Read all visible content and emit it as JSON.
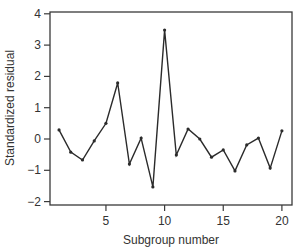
{
  "chart_data": {
    "type": "line",
    "title": "",
    "xlabel": "Subgroup number",
    "ylabel": "Standardized residual",
    "xlim": [
      0.2,
      20.7
    ],
    "ylim": [
      -2.1,
      4.2
    ],
    "xticks": [
      5,
      10,
      15,
      20
    ],
    "xtick_labels": [
      "5",
      "10",
      "15",
      "20"
    ],
    "yticks": [
      -2,
      -1,
      0,
      1,
      2,
      3,
      4
    ],
    "ytick_labels": [
      "−2",
      "−1",
      "0",
      "1",
      "2",
      "3",
      "4"
    ],
    "grid": false,
    "legend": null,
    "markers": true,
    "series": [
      {
        "name": "Standardized residual",
        "x": [
          1,
          2,
          3,
          4,
          5,
          6,
          7,
          8,
          9,
          10,
          11,
          12,
          13,
          14,
          15,
          16,
          17,
          18,
          19,
          20
        ],
        "values": [
          0.29,
          -0.42,
          -0.67,
          -0.06,
          0.5,
          1.79,
          -0.8,
          0.03,
          -1.53,
          3.48,
          -0.51,
          0.32,
          0.0,
          -0.58,
          -0.35,
          -1.02,
          -0.19,
          0.03,
          -0.93,
          0.26
        ]
      }
    ]
  },
  "colors": {
    "line": "#2b2b2b",
    "frame": "#3a3a3a",
    "text": "#333333"
  }
}
